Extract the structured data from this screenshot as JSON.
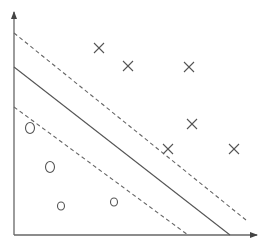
{
  "diagram": {
    "title": "",
    "type": "svm-maximum-margin",
    "colors": {
      "axis": "#666666",
      "hyperplane": "#555555",
      "margin": "#666666",
      "marker": "#555555",
      "background": "#ffffff"
    },
    "axes": {
      "origin": [
        14,
        235
      ],
      "y_end": [
        14,
        10
      ],
      "x_end": [
        259,
        235
      ],
      "x_label": "",
      "y_label": ""
    },
    "lines": [
      {
        "name": "upper-margin",
        "style": "dashed",
        "from": [
          14,
          33
        ],
        "to": [
          246,
          220
        ]
      },
      {
        "name": "decision-boundary",
        "style": "solid",
        "from": [
          14,
          67
        ],
        "to": [
          230,
          235
        ]
      },
      {
        "name": "lower-margin",
        "style": "dashed",
        "from": [
          14,
          107
        ],
        "to": [
          188,
          235
        ]
      }
    ],
    "positive_class": {
      "marker": "cross",
      "points": [
        [
          99,
          48
        ],
        [
          128,
          66
        ],
        [
          189,
          67
        ],
        [
          192,
          124
        ],
        [
          168,
          149
        ],
        [
          234,
          149
        ]
      ]
    },
    "negative_class": {
      "marker": "circle",
      "points": [
        {
          "c": [
            30,
            128
          ],
          "rx": 4.5,
          "ry": 5.5
        },
        {
          "c": [
            50,
            167
          ],
          "rx": 4.5,
          "ry": 5.5
        },
        {
          "c": [
            61,
            206
          ],
          "rx": 3.5,
          "ry": 4
        },
        {
          "c": [
            114,
            202
          ],
          "rx": 3.5,
          "ry": 4
        }
      ]
    }
  }
}
